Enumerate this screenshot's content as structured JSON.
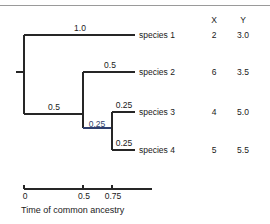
{
  "figure": {
    "title": "",
    "axis_caption": "Time of common ancestry",
    "columns": {
      "x_header": "X",
      "y_header": "Y"
    },
    "axis": {
      "ticks": [
        {
          "label": "0",
          "value": 0,
          "px": 24
        },
        {
          "label": "0.5",
          "value": 0.5,
          "px": 83
        },
        {
          "label": "0.75",
          "value": 0.75,
          "px": 112
        }
      ],
      "line_start_px": 24,
      "line_end_px": 152
    },
    "taxa": [
      {
        "name": "species 1",
        "x": "2",
        "y": "3.0"
      },
      {
        "name": "species 2",
        "x": "6",
        "y": "3.5"
      },
      {
        "name": "species 3",
        "x": "4",
        "y": "5.0"
      },
      {
        "name": "species 4",
        "x": "5",
        "y": "5.5"
      }
    ],
    "branch_labels": [
      {
        "id": "b1",
        "text": "1.0",
        "color": "dark"
      },
      {
        "id": "b2",
        "text": "0.5",
        "color": "dark"
      },
      {
        "id": "b3",
        "text": "0.5",
        "color": "dark"
      },
      {
        "id": "b4",
        "text": "0.25",
        "color": "blue"
      },
      {
        "id": "b5",
        "text": "0.25",
        "color": "dark"
      },
      {
        "id": "b6",
        "text": "0.25",
        "color": "dark"
      }
    ],
    "colors": {
      "line": "#262626",
      "accent_blue": "#2f3f6e",
      "rule": "#9a9a9a",
      "text": "#1a1a1a"
    }
  }
}
